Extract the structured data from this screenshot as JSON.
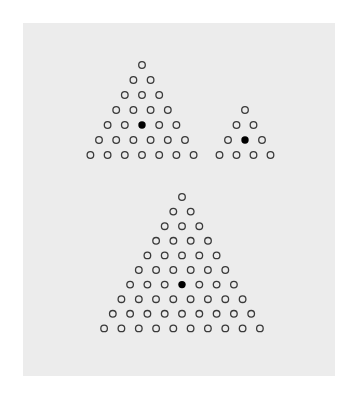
{
  "panel": {
    "background": "#ececec"
  },
  "diagram": {
    "triangles": [
      {
        "name": "large-top-triangle",
        "rows": 7,
        "total_dots": 28,
        "apex": [
          142,
          65
        ],
        "dx": 17.2,
        "dy": 15,
        "filled": {
          "row": 5,
          "index": 3
        }
      },
      {
        "name": "small-triangle",
        "rows": 4,
        "total_dots": 10,
        "apex": [
          245,
          110
        ],
        "dx": 17,
        "dy": 15,
        "filled": {
          "row": 3,
          "index": 2
        }
      },
      {
        "name": "bottom-triangle",
        "rows": 10,
        "total_dots": 55,
        "apex": [
          182,
          197
        ],
        "dx": 17.3,
        "dy": 14.6,
        "filled": {
          "row": 7,
          "index": 4
        }
      }
    ],
    "dot_radius": 3.3,
    "stroke_color": "#3a3a3a",
    "fill_color": "#000000"
  }
}
